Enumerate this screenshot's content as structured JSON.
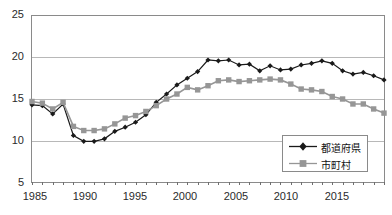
{
  "chart": {
    "title": "",
    "ylabel": "",
    "xlabel": "",
    "ytick_labels": [
      "25",
      "20",
      "15",
      "10",
      "5"
    ],
    "xtick_labels": [
      "1985",
      "1990",
      "1995",
      "2000",
      "2005",
      "2010",
      "2015"
    ],
    "series_color_prefecture": "#1a1a1a",
    "series_color_municipality": "#969696"
  },
  "legend": {
    "items": [
      {
        "label": "都道府県",
        "marker": "diamond",
        "color": "#1a1a1a"
      },
      {
        "label": "市町村",
        "marker": "square",
        "color": "#969696"
      }
    ]
  },
  "chart_data": {
    "type": "line",
    "title": "",
    "xlabel": "",
    "ylabel": "",
    "xlim": [
      1985,
      2019
    ],
    "ylim": [
      5,
      25
    ],
    "yticks": [
      5,
      10,
      15,
      20,
      25
    ],
    "xticks": [
      1985,
      1990,
      1995,
      2000,
      2005,
      2010,
      2015
    ],
    "grid": true,
    "legend_position": "bottom-right",
    "x": [
      1985,
      1986,
      1987,
      1988,
      1989,
      1990,
      1991,
      1992,
      1993,
      1994,
      1995,
      1996,
      1997,
      1998,
      1999,
      2000,
      2001,
      2002,
      2003,
      2004,
      2005,
      2006,
      2007,
      2008,
      2009,
      2010,
      2011,
      2012,
      2013,
      2014,
      2015,
      2016,
      2017,
      2018,
      2019
    ],
    "series": [
      {
        "name": "都道府県",
        "marker": "diamond",
        "color": "#1a1a1a",
        "values": [
          14.3,
          14.2,
          13.2,
          14.4,
          10.6,
          9.9,
          9.9,
          10.2,
          11.1,
          11.6,
          12.2,
          13.1,
          14.6,
          15.6,
          16.7,
          17.5,
          18.3,
          19.7,
          19.6,
          19.7,
          19.1,
          19.2,
          18.4,
          19.0,
          18.5,
          18.6,
          19.1,
          19.3,
          19.6,
          19.3,
          18.4,
          18.0,
          18.2,
          17.8,
          17.3
        ]
      },
      {
        "name": "市町村",
        "marker": "square",
        "color": "#969696",
        "values": [
          14.7,
          14.5,
          13.8,
          14.6,
          11.7,
          11.2,
          11.2,
          11.4,
          12.0,
          12.7,
          13.0,
          13.5,
          14.2,
          15.0,
          15.6,
          16.4,
          16.1,
          16.6,
          17.2,
          17.3,
          17.1,
          17.2,
          17.3,
          17.4,
          17.3,
          16.8,
          16.2,
          16.1,
          15.9,
          15.3,
          15.0,
          14.4,
          14.4,
          13.8,
          13.3
        ]
      }
    ]
  }
}
